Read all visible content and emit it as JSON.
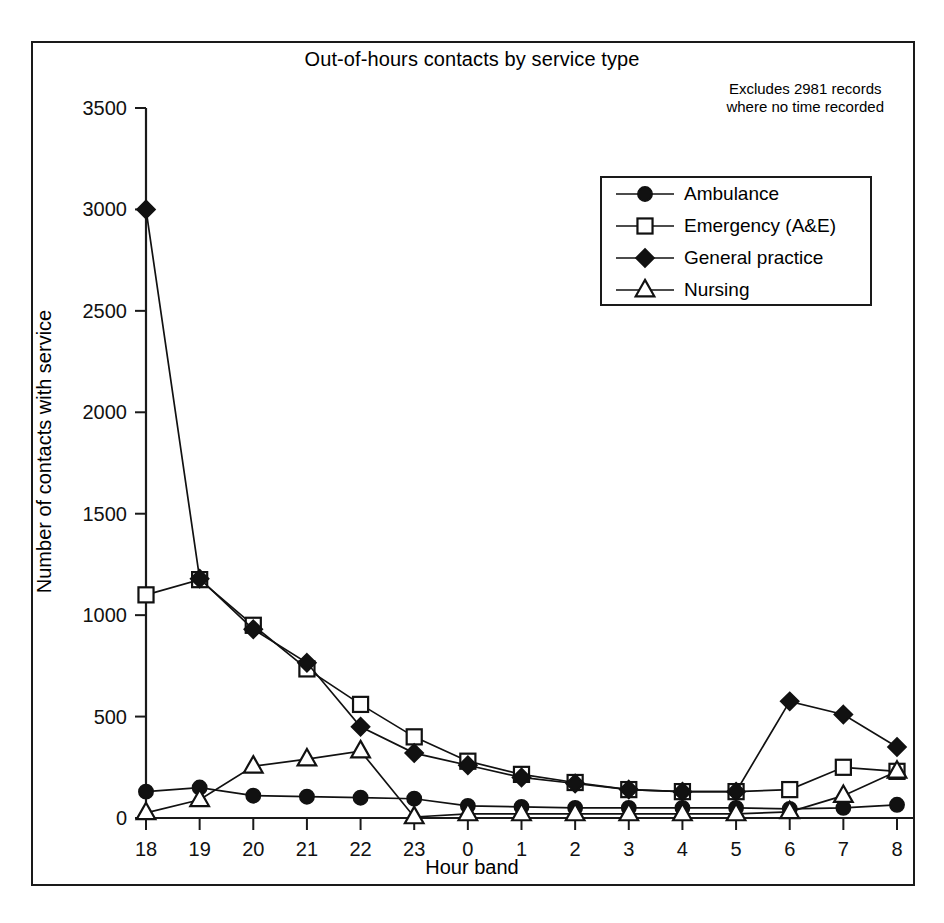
{
  "chart_data": {
    "type": "line",
    "title": "Out-of-hours contacts by service type",
    "xlabel": "Hour band",
    "ylabel": "Number of contacts with service",
    "annotation": "Excludes 2981 records\nwhere no time recorded",
    "annotation_line1": "Excludes 2981 records",
    "annotation_line2": "where no time recorded",
    "categories": [
      "18",
      "19",
      "20",
      "21",
      "22",
      "23",
      "0",
      "1",
      "2",
      "3",
      "4",
      "5",
      "6",
      "7",
      "8"
    ],
    "ylim": [
      0,
      3500
    ],
    "yticks": [
      0,
      500,
      1000,
      1500,
      2000,
      2500,
      3000,
      3500
    ],
    "ytick_labels": [
      "0",
      "500",
      "1000",
      "1500",
      "2000",
      "2500",
      "3000",
      "3500"
    ],
    "grid": false,
    "legend_position": "upper right",
    "series": [
      {
        "name": "Ambulance",
        "marker": "filled-circle",
        "values": [
          130,
          150,
          110,
          105,
          100,
          95,
          60,
          55,
          50,
          50,
          50,
          50,
          45,
          50,
          65
        ]
      },
      {
        "name": "Emergency (A&E)",
        "marker": "open-square",
        "values": [
          1100,
          1175,
          950,
          735,
          560,
          400,
          280,
          215,
          175,
          140,
          130,
          130,
          140,
          250,
          230
        ]
      },
      {
        "name": "General practice",
        "marker": "filled-diamond",
        "values": [
          3000,
          1180,
          930,
          765,
          450,
          320,
          260,
          200,
          170,
          140,
          130,
          130,
          575,
          510,
          350
        ]
      },
      {
        "name": "Nursing",
        "marker": "open-triangle",
        "values": [
          25,
          90,
          255,
          290,
          330,
          5,
          20,
          20,
          20,
          20,
          20,
          20,
          30,
          110,
          230
        ]
      }
    ]
  },
  "colors": {
    "ink": "#111111",
    "frame": "#1a1a1a",
    "background": "#ffffff"
  }
}
